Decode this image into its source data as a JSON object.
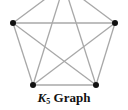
{
  "caption": {
    "symbol": "K",
    "subscript": "5",
    "text": "Graph"
  },
  "graph": {
    "name": "K5 complete graph",
    "edge_color": "#a8a8a8",
    "vertex_color": "#111111",
    "vertices": [
      {
        "id": "top",
        "x": 64,
        "y": -15
      },
      {
        "id": "left",
        "x": 13,
        "y": 23
      },
      {
        "id": "right",
        "x": 115,
        "y": 23
      },
      {
        "id": "bottom-left",
        "x": 33,
        "y": 85
      },
      {
        "id": "bottom-right",
        "x": 96,
        "y": 85
      }
    ]
  }
}
